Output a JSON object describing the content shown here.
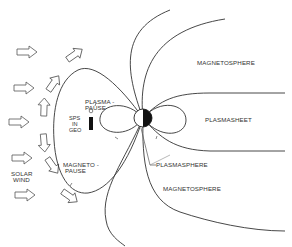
{
  "diagram": {
    "type": "schematic",
    "labels": {
      "magnetosphere_top": "MAGNETOSPHERE",
      "plasmasheet": "PLASMASHEET",
      "plasmapause_1": "PLASMA -",
      "plasmapause_2": "PAUSE",
      "sps_1": "SPS",
      "sps_2": "IN",
      "sps_3": "GEO",
      "magnetopause_1": "MAGNETO -",
      "magnetopause_2": "PAUSE",
      "solar_wind_1": "SOLAR",
      "solar_wind_2": "WIND",
      "plasmasphere": "PLASMASPHERE",
      "magnetosphere_bottom": "MAGNETOSPHERE"
    },
    "elements": [
      {
        "name": "earth",
        "shape": "circle",
        "note": "half white (day side) / half black (night side)"
      },
      {
        "name": "solar-wind-arrows",
        "count": 10,
        "direction": "left-to-right, deflected around magnetopause"
      },
      {
        "name": "magnetopause-boundary"
      },
      {
        "name": "plasmapause-loops"
      },
      {
        "name": "plasmasheet-boundaries"
      },
      {
        "name": "magnetic-field-lines"
      },
      {
        "name": "sps-satellite"
      }
    ],
    "colors": {
      "line": "#333333",
      "background": "#ffffff",
      "earth_night": "#111111"
    }
  }
}
